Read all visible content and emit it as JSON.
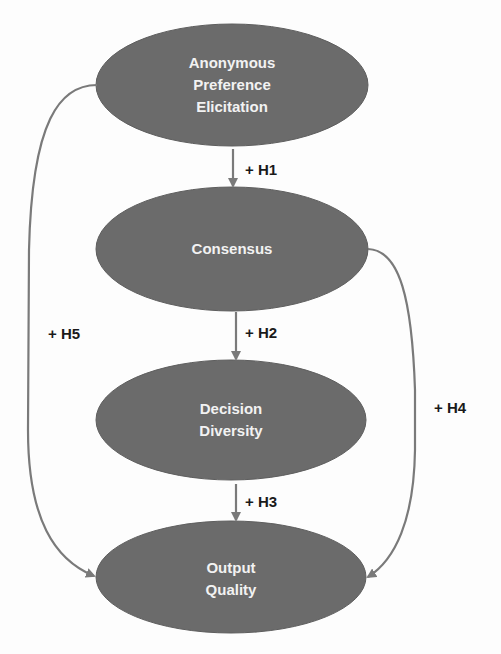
{
  "diagram": {
    "type": "path-model",
    "colors": {
      "node_fill": "#6b6b6b",
      "node_text": "#f2f2f2",
      "edge": "#7a7a7a",
      "label_text": "#1a1a1a",
      "background": "#fdfdfd"
    },
    "nodes": [
      {
        "id": "ape",
        "lines": [
          "Anonymous",
          "Preference",
          "Elicitation"
        ],
        "cx": 232,
        "cy": 85,
        "rx": 136,
        "ry": 61
      },
      {
        "id": "consensus",
        "lines": [
          "Consensus"
        ],
        "cx": 232,
        "cy": 249,
        "rx": 136,
        "ry": 62
      },
      {
        "id": "diversity",
        "lines": [
          "Decision",
          "Diversity"
        ],
        "cx": 231,
        "cy": 420,
        "rx": 135,
        "ry": 60
      },
      {
        "id": "quality",
        "lines": [
          "Output",
          "Quality"
        ],
        "cx": 231,
        "cy": 577,
        "rx": 135,
        "ry": 56
      }
    ],
    "edges": [
      {
        "id": "h1",
        "from": "ape",
        "to": "consensus",
        "label": "+ H1",
        "label_x": 245,
        "label_y": 170
      },
      {
        "id": "h2",
        "from": "consensus",
        "to": "diversity",
        "label": "+ H2",
        "label_x": 245,
        "label_y": 333
      },
      {
        "id": "h3",
        "from": "diversity",
        "to": "quality",
        "label": "+ H3",
        "label_x": 245,
        "label_y": 502
      },
      {
        "id": "h4",
        "from": "consensus",
        "to": "quality",
        "label": "+ H4",
        "label_x": 434,
        "label_y": 408
      },
      {
        "id": "h5",
        "from": "ape",
        "to": "quality",
        "label": "+ H5",
        "label_x": 48,
        "label_y": 334
      }
    ]
  }
}
